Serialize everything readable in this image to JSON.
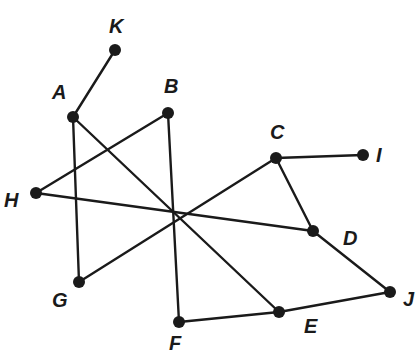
{
  "diagram": {
    "type": "graph",
    "nodes": [
      {
        "id": "K",
        "label": "K",
        "x": 115,
        "y": 50,
        "lx": 109,
        "ly": 33
      },
      {
        "id": "A",
        "label": "A",
        "x": 73,
        "y": 117,
        "lx": 52,
        "ly": 99
      },
      {
        "id": "B",
        "label": "B",
        "x": 168,
        "y": 113,
        "lx": 164,
        "ly": 93
      },
      {
        "id": "C",
        "label": "C",
        "x": 276,
        "y": 158,
        "lx": 270,
        "ly": 139
      },
      {
        "id": "I",
        "label": "I",
        "x": 363,
        "y": 155,
        "lx": 376,
        "ly": 162
      },
      {
        "id": "H",
        "label": "H",
        "x": 36,
        "y": 193,
        "lx": 4,
        "ly": 207
      },
      {
        "id": "D",
        "label": "D",
        "x": 313,
        "y": 231,
        "lx": 343,
        "ly": 245
      },
      {
        "id": "G",
        "label": "G",
        "x": 79,
        "y": 282,
        "lx": 52,
        "ly": 307
      },
      {
        "id": "F",
        "label": "F",
        "x": 179,
        "y": 322,
        "lx": 169,
        "ly": 350
      },
      {
        "id": "E",
        "label": "E",
        "x": 279,
        "y": 312,
        "lx": 304,
        "ly": 333
      },
      {
        "id": "J",
        "label": "J",
        "x": 390,
        "y": 292,
        "lx": 403,
        "ly": 306
      }
    ],
    "edges": [
      [
        "K",
        "A"
      ],
      [
        "A",
        "G"
      ],
      [
        "A",
        "E"
      ],
      [
        "B",
        "H"
      ],
      [
        "B",
        "F"
      ],
      [
        "C",
        "I"
      ],
      [
        "C",
        "G"
      ],
      [
        "C",
        "D"
      ],
      [
        "H",
        "D"
      ],
      [
        "D",
        "J"
      ],
      [
        "F",
        "E"
      ],
      [
        "E",
        "J"
      ]
    ],
    "colors": {
      "ink": "#1a1a1a",
      "background": "#ffffff"
    }
  }
}
